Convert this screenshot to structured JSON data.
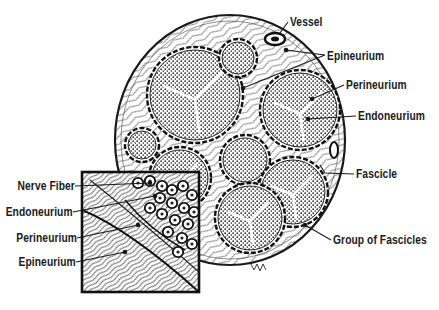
{
  "figure": {
    "colors": {
      "ink": "#1a1a1a",
      "paper": "#ffffff",
      "fill_dot": "#2b2b2b"
    }
  },
  "labels": {
    "right": {
      "vessel": "Vessel",
      "epineurium": "Epineurium",
      "perineurium": "Perineurium",
      "endoneurium": "Endoneurium",
      "fascicle": "Fascicle",
      "group_of_fascicles": "Group of Fascicles"
    },
    "inset": {
      "nerve_fiber": "Nerve Fiber",
      "endoneurium": "Endoneurium",
      "perineurium": "Perineurium",
      "epineurium": "Epineurium"
    }
  },
  "structure": {
    "nerve_outline": {
      "cx": 230,
      "cy": 140,
      "rx": 115,
      "ry": 125
    },
    "fascicles": [
      {
        "id": "large-upper-left",
        "cx": 195,
        "cy": 95,
        "r": 45
      },
      {
        "id": "small-top",
        "cx": 238,
        "cy": 58,
        "r": 16
      },
      {
        "id": "right-upper",
        "cx": 300,
        "cy": 110,
        "r": 37
      },
      {
        "id": "small-left",
        "cx": 142,
        "cy": 145,
        "r": 14
      },
      {
        "id": "center-small",
        "cx": 245,
        "cy": 160,
        "r": 22
      },
      {
        "id": "right-lower",
        "cx": 293,
        "cy": 192,
        "r": 32
      },
      {
        "id": "bottom-center",
        "cx": 250,
        "cy": 218,
        "r": 32
      },
      {
        "id": "left-lower",
        "cx": 180,
        "cy": 178,
        "r": 28
      }
    ],
    "inset_box": {
      "x": 81,
      "y": 171,
      "w": 119,
      "h": 122
    }
  }
}
